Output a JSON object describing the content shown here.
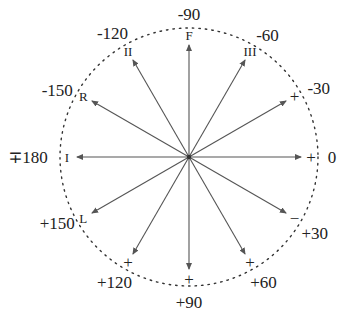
{
  "diagram": {
    "type": "polar-vector-diagram",
    "center": {
      "x": 189,
      "y": 157
    },
    "radius": 129,
    "arrow_length": 112,
    "colors": {
      "circle": "#333333",
      "arrow": "#555555",
      "text": "#222222"
    },
    "spokes": [
      {
        "angle": 0,
        "angle_label": "0",
        "tip": "+",
        "tip_kind": "sign"
      },
      {
        "angle": 30,
        "angle_label": "+30",
        "tip": "−",
        "tip_kind": "sign"
      },
      {
        "angle": 60,
        "angle_label": "+60",
        "tip": "+",
        "tip_kind": "sign"
      },
      {
        "angle": 90,
        "angle_label": "+90",
        "tip": "+",
        "tip_kind": "sign"
      },
      {
        "angle": 120,
        "angle_label": "+120",
        "tip": "+",
        "tip_kind": "sign"
      },
      {
        "angle": 150,
        "angle_label": "+150",
        "tip": "L",
        "tip_kind": "lead"
      },
      {
        "angle": 180,
        "angle_label": "∓180",
        "tip": "I",
        "tip_kind": "lead"
      },
      {
        "angle": -150,
        "angle_label": "-150",
        "tip": "R",
        "tip_kind": "lead"
      },
      {
        "angle": -120,
        "angle_label": "-120",
        "tip": "II",
        "tip_kind": "lead"
      },
      {
        "angle": -90,
        "angle_label": "-90",
        "tip": "F",
        "tip_kind": "lead"
      },
      {
        "angle": -60,
        "angle_label": "-60",
        "tip": "III",
        "tip_kind": "lead"
      },
      {
        "angle": -30,
        "angle_label": "-30",
        "tip": "+",
        "tip_kind": "sign"
      }
    ]
  }
}
